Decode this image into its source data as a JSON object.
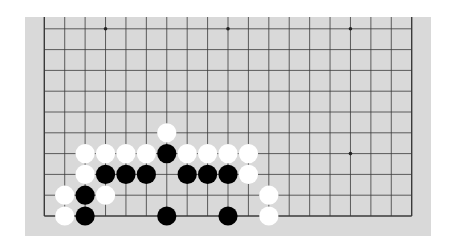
{
  "board": {
    "size": 19,
    "visible_rows": 10,
    "orientation": "bottom-edge visible; board extends beyond top",
    "colors": {
      "background": "#d9d9d9",
      "line": "#3a3a3a",
      "black_stone": "#000000",
      "white_stone": "#ffffff"
    },
    "star_points": [
      {
        "col": 3,
        "row": 0
      },
      {
        "col": 9,
        "row": 0
      },
      {
        "col": 15,
        "row": 0
      },
      {
        "col": 15,
        "row": 6
      }
    ],
    "stones": [
      {
        "color": "white",
        "col": 6,
        "row": 5
      },
      {
        "color": "white",
        "col": 2,
        "row": 6
      },
      {
        "color": "white",
        "col": 3,
        "row": 6
      },
      {
        "color": "white",
        "col": 4,
        "row": 6
      },
      {
        "color": "white",
        "col": 5,
        "row": 6
      },
      {
        "color": "black",
        "col": 6,
        "row": 6
      },
      {
        "color": "white",
        "col": 7,
        "row": 6
      },
      {
        "color": "white",
        "col": 8,
        "row": 6
      },
      {
        "color": "white",
        "col": 9,
        "row": 6
      },
      {
        "color": "white",
        "col": 10,
        "row": 6
      },
      {
        "color": "white",
        "col": 2,
        "row": 7
      },
      {
        "color": "black",
        "col": 3,
        "row": 7
      },
      {
        "color": "black",
        "col": 4,
        "row": 7
      },
      {
        "color": "black",
        "col": 5,
        "row": 7
      },
      {
        "color": "black",
        "col": 7,
        "row": 7
      },
      {
        "color": "black",
        "col": 8,
        "row": 7
      },
      {
        "color": "black",
        "col": 9,
        "row": 7
      },
      {
        "color": "white",
        "col": 10,
        "row": 7
      },
      {
        "color": "white",
        "col": 1,
        "row": 8
      },
      {
        "color": "black",
        "col": 2,
        "row": 8
      },
      {
        "color": "white",
        "col": 3,
        "row": 8
      },
      {
        "color": "white",
        "col": 11,
        "row": 8
      },
      {
        "color": "white",
        "col": 1,
        "row": 9
      },
      {
        "color": "black",
        "col": 2,
        "row": 9
      },
      {
        "color": "black",
        "col": 6,
        "row": 9
      },
      {
        "color": "black",
        "col": 9,
        "row": 9
      },
      {
        "color": "white",
        "col": 11,
        "row": 9
      }
    ]
  }
}
